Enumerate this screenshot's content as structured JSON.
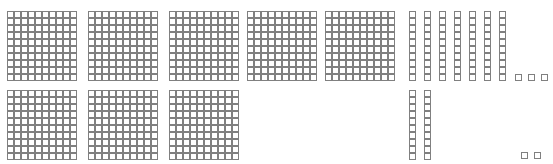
{
  "canvas": {
    "width": 553,
    "height": 164,
    "background": "#ffffff",
    "line_color": "#808080",
    "cell_fill": "#ffffff"
  },
  "manipulative": {
    "kind": "base-ten-blocks",
    "cell_size_px": 7,
    "counts": {
      "hundreds_flats": 8,
      "tens_rods": 9,
      "unit_cubes": 5
    },
    "value": {
      "hundreds": 800,
      "tens": 90,
      "ones": 5,
      "total": 895
    }
  },
  "blocks": [
    {
      "name": "hundred-flat",
      "type": "flat",
      "cols": 10,
      "rows": 10,
      "x": 7,
      "y": 11
    },
    {
      "name": "hundred-flat",
      "type": "flat",
      "cols": 10,
      "rows": 10,
      "x": 88,
      "y": 11
    },
    {
      "name": "hundred-flat",
      "type": "flat",
      "cols": 10,
      "rows": 10,
      "x": 169,
      "y": 11
    },
    {
      "name": "hundred-flat",
      "type": "flat",
      "cols": 10,
      "rows": 10,
      "x": 247,
      "y": 11
    },
    {
      "name": "hundred-flat",
      "type": "flat",
      "cols": 10,
      "rows": 10,
      "x": 325,
      "y": 11
    },
    {
      "name": "hundred-flat",
      "type": "flat",
      "cols": 10,
      "rows": 10,
      "x": 7,
      "y": 90
    },
    {
      "name": "hundred-flat",
      "type": "flat",
      "cols": 10,
      "rows": 10,
      "x": 88,
      "y": 90
    },
    {
      "name": "hundred-flat",
      "type": "flat",
      "cols": 10,
      "rows": 10,
      "x": 169,
      "y": 90
    },
    {
      "name": "ten-rod",
      "type": "rod",
      "cols": 1,
      "rows": 10,
      "x": 409,
      "y": 11
    },
    {
      "name": "ten-rod",
      "type": "rod",
      "cols": 1,
      "rows": 10,
      "x": 424,
      "y": 11
    },
    {
      "name": "ten-rod",
      "type": "rod",
      "cols": 1,
      "rows": 10,
      "x": 439,
      "y": 11
    },
    {
      "name": "ten-rod",
      "type": "rod",
      "cols": 1,
      "rows": 10,
      "x": 454,
      "y": 11
    },
    {
      "name": "ten-rod",
      "type": "rod",
      "cols": 1,
      "rows": 10,
      "x": 469,
      "y": 11
    },
    {
      "name": "ten-rod",
      "type": "rod",
      "cols": 1,
      "rows": 10,
      "x": 484,
      "y": 11
    },
    {
      "name": "ten-rod",
      "type": "rod",
      "cols": 1,
      "rows": 10,
      "x": 499,
      "y": 11
    },
    {
      "name": "ten-rod",
      "type": "rod",
      "cols": 1,
      "rows": 10,
      "x": 409,
      "y": 90
    },
    {
      "name": "ten-rod",
      "type": "rod",
      "cols": 1,
      "rows": 10,
      "x": 424,
      "y": 90
    },
    {
      "name": "unit-cube",
      "type": "unit",
      "cols": 1,
      "rows": 1,
      "x": 515,
      "y": 74
    },
    {
      "name": "unit-cube",
      "type": "unit",
      "cols": 1,
      "rows": 1,
      "x": 528,
      "y": 74
    },
    {
      "name": "unit-cube",
      "type": "unit",
      "cols": 1,
      "rows": 1,
      "x": 541,
      "y": 74
    },
    {
      "name": "unit-cube",
      "type": "unit",
      "cols": 1,
      "rows": 1,
      "x": 521,
      "y": 152
    },
    {
      "name": "unit-cube",
      "type": "unit",
      "cols": 1,
      "rows": 1,
      "x": 534,
      "y": 152
    }
  ]
}
